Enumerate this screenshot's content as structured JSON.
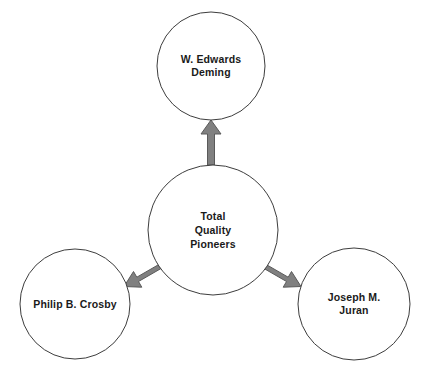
{
  "diagram": {
    "type": "hub-and-spoke",
    "background_color": "#ffffff",
    "node_fill": "#ffffff",
    "node_stroke": "#3d3d3d",
    "arrow_fill": "#808080",
    "arrow_stroke": "#5a5a5a",
    "text_color": "#1a1a1a",
    "center": {
      "id": "total-quality-pioneers",
      "label": "Total\nQuality\nPioneers",
      "cx": 213,
      "cy": 230,
      "r": 65
    },
    "nodes": [
      {
        "id": "deming",
        "label": "W. Edwards\nDeming",
        "cx": 211,
        "cy": 66,
        "r": 54
      },
      {
        "id": "crosby",
        "label": "Philip B. Crosby",
        "cx": 75,
        "cy": 304,
        "r": 55
      },
      {
        "id": "juran",
        "label": "Joseph M. Juran",
        "cx": 354,
        "cy": 304,
        "r": 56
      }
    ],
    "arrows": [
      {
        "id": "arrow-to-deming",
        "from": "total-quality-pioneers",
        "to": "deming",
        "direction": "up"
      },
      {
        "id": "arrow-to-crosby",
        "from": "total-quality-pioneers",
        "to": "crosby",
        "direction": "down-left"
      },
      {
        "id": "arrow-to-juran",
        "from": "total-quality-pioneers",
        "to": "juran",
        "direction": "down-right"
      }
    ]
  }
}
